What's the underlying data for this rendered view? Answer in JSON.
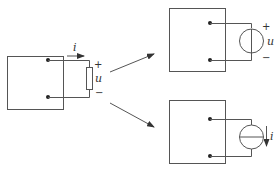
{
  "diagram": {
    "type": "circuit-equivalence",
    "colors": {
      "line": "#555555",
      "text": "#333333",
      "background": "#ffffff"
    },
    "source_circuit": {
      "element": "resistor",
      "current_label": "i",
      "voltage_label": "u",
      "plus_sign": "+",
      "minus_sign": "−"
    },
    "equivalent_voltage_source": {
      "element": "voltage-source",
      "voltage_label": "u",
      "plus_sign": "+",
      "minus_sign": "−"
    },
    "equivalent_current_source": {
      "element": "current-source",
      "current_label": "i"
    },
    "arrows": [
      {
        "from": "source_circuit",
        "to": "equivalent_voltage_source"
      },
      {
        "from": "source_circuit",
        "to": "equivalent_current_source"
      }
    ]
  }
}
